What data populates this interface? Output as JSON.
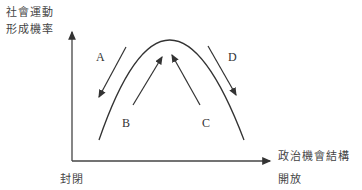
{
  "diagram": {
    "y_axis_label_line1": "社會運動",
    "y_axis_label_line2": "形成機率",
    "x_axis_label": "政治機會結構",
    "x_axis_low": "封閉",
    "x_axis_high": "開放",
    "arrows": [
      {
        "label": "A",
        "direction": "down-left"
      },
      {
        "label": "B",
        "direction": "up-right"
      },
      {
        "label": "C",
        "direction": "up-left"
      },
      {
        "label": "D",
        "direction": "down-right"
      }
    ],
    "curve": "inverted-U"
  }
}
